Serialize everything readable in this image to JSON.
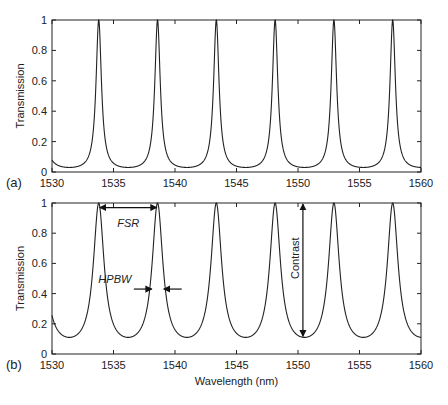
{
  "chart_data": [
    {
      "type": "line",
      "panel_label": "(a)",
      "title": "",
      "xlabel": "",
      "ylabel": "Transmission",
      "xlim": [
        1530,
        1560
      ],
      "ylim": [
        0,
        1
      ],
      "xticks": [
        1530,
        1535,
        1540,
        1545,
        1550,
        1555,
        1560
      ],
      "yticks": [
        0,
        0.2,
        0.4,
        0.6,
        0.8,
        1
      ],
      "ytick_labels": [
        "0",
        "0.2",
        "0.4",
        "0.6",
        "0.8",
        "1"
      ],
      "peaks_nm": [
        1533.8,
        1538.6,
        1543.3,
        1548.1,
        1552.9,
        1557.7
      ],
      "peak_value": 1.0,
      "min_value": 0.03,
      "finesse_hint": "narrow",
      "grid": false
    },
    {
      "type": "line",
      "panel_label": "(b)",
      "title": "",
      "xlabel": "Wavelength (nm)",
      "ylabel": "Transmission",
      "xlim": [
        1530,
        1560
      ],
      "ylim": [
        0,
        1
      ],
      "xticks": [
        1530,
        1535,
        1540,
        1545,
        1550,
        1555,
        1560
      ],
      "yticks": [
        0,
        0.2,
        0.4,
        0.6,
        0.8,
        1
      ],
      "ytick_labels": [
        "0",
        "0.2",
        "0.4",
        "0.6",
        "0.8",
        "1"
      ],
      "peaks_nm": [
        1533.8,
        1538.6,
        1543.3,
        1548.1,
        1552.9,
        1557.7
      ],
      "peak_value": 1.0,
      "min_value": 0.11,
      "finesse_hint": "broad",
      "grid": false,
      "annotations": [
        {
          "text": "FSR",
          "type": "double-arrow-horizontal",
          "from_x": 1533.8,
          "to_x": 1538.6,
          "y": 0.97
        },
        {
          "text": "HPBW",
          "type": "inward-arrows",
          "x_left": 1538.2,
          "x_right": 1539.0,
          "y": 0.43
        },
        {
          "text": "Contrast",
          "type": "double-arrow-vertical",
          "x": 1550.4,
          "from_y": 0.11,
          "to_y": 1.0
        }
      ]
    }
  ]
}
